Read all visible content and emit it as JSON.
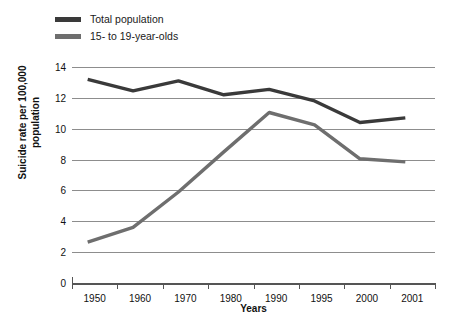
{
  "chart_data": {
    "type": "line",
    "title": "",
    "xlabel": "Years",
    "ylabel": "Suicide rate per 100,000 population",
    "categories": [
      "1950",
      "1960",
      "1970",
      "1980",
      "1990",
      "1995",
      "2000",
      "2001"
    ],
    "ylim": [
      0,
      14
    ],
    "ytick_labels": [
      "14",
      "12",
      "10",
      "8",
      "6",
      "4",
      "2",
      "0"
    ],
    "ytick_values": [
      14,
      12,
      10,
      8,
      6,
      4,
      2,
      0
    ],
    "grid": true,
    "legend_position": "top-left",
    "series": [
      {
        "name": "Total population",
        "color": "#3a3a3a",
        "values": [
          13.2,
          12.45,
          13.1,
          12.2,
          12.55,
          11.8,
          10.4,
          10.7
        ]
      },
      {
        "name": "15- to 19-year-olds",
        "color": "#6e6e6e",
        "values": [
          2.65,
          3.6,
          5.9,
          8.5,
          11.05,
          10.25,
          8.05,
          7.85
        ]
      }
    ]
  },
  "legend": {
    "items": [
      {
        "label": "Total population",
        "color": "#3a3a3a"
      },
      {
        "label": "15- to 19-year-olds",
        "color": "#6e6e6e"
      }
    ]
  },
  "axes": {
    "y_title_line1": "Suicide rate per 100,000",
    "y_title_line2": "population",
    "x_title": "Years"
  }
}
